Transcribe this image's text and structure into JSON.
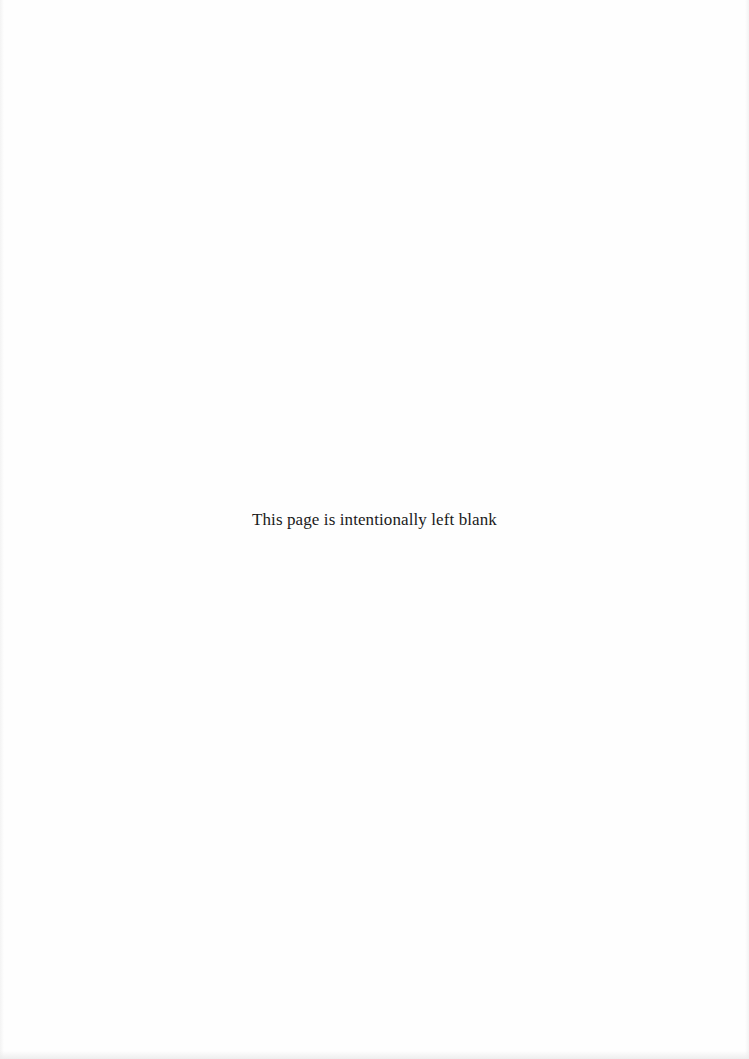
{
  "page": {
    "notice_text": "This page is intentionally left blank",
    "background_color": "#fefefe",
    "text_color": "#1a1a1a"
  }
}
